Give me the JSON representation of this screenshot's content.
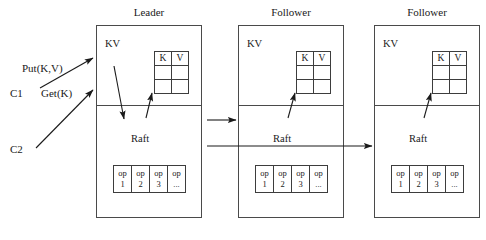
{
  "diagram": {
    "nodes": [
      {
        "title": "Leader",
        "kv_layer_label": "KV",
        "raft_layer_label": "Raft",
        "kv_table": {
          "headers": [
            "K",
            "V"
          ],
          "rows": [
            [
              "",
              ""
            ],
            [
              "",
              ""
            ]
          ]
        },
        "log_table": {
          "cells": [
            {
              "top": "op",
              "bottom": "1"
            },
            {
              "top": "op",
              "bottom": "2"
            },
            {
              "top": "op",
              "bottom": "3"
            },
            {
              "top": "op",
              "bottom": "..."
            }
          ]
        }
      },
      {
        "title": "Follower",
        "kv_layer_label": "KV",
        "raft_layer_label": "Raft",
        "kv_table": {
          "headers": [
            "K",
            "V"
          ],
          "rows": [
            [
              "",
              ""
            ],
            [
              "",
              ""
            ]
          ]
        },
        "log_table": {
          "cells": [
            {
              "top": "op",
              "bottom": "1"
            },
            {
              "top": "op",
              "bottom": "2"
            },
            {
              "top": "op",
              "bottom": "3"
            },
            {
              "top": "op",
              "bottom": "..."
            }
          ]
        }
      },
      {
        "title": "Follower",
        "kv_layer_label": "KV",
        "raft_layer_label": "Raft",
        "kv_table": {
          "headers": [
            "K",
            "V"
          ],
          "rows": [
            [
              "",
              ""
            ],
            [
              "",
              ""
            ]
          ]
        },
        "log_table": {
          "cells": [
            {
              "top": "op",
              "bottom": "1"
            },
            {
              "top": "op",
              "bottom": "2"
            },
            {
              "top": "op",
              "bottom": "3"
            },
            {
              "top": "op",
              "bottom": "..."
            }
          ]
        }
      }
    ],
    "clients": [
      {
        "name": "C1",
        "operation": "Put(K,V)"
      },
      {
        "name": "C2",
        "operation": "Get(K)"
      }
    ],
    "colors": {
      "stroke": "#4a4a4a",
      "text": "#1a1a1a",
      "background": "#ffffff"
    }
  }
}
